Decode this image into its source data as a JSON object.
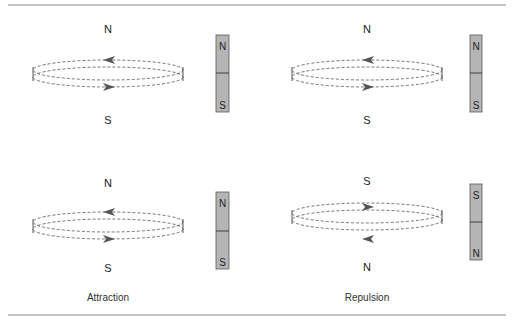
{
  "panels": [
    {
      "id": "top-left",
      "loop_top_label": "N",
      "loop_bottom_label": "S",
      "magnet_top_pole": "N",
      "magnet_bottom_pole": "S",
      "upper_arrow": "left",
      "lower_arrow": "right"
    },
    {
      "id": "top-right",
      "loop_top_label": "N",
      "loop_bottom_label": "S",
      "magnet_top_pole": "N",
      "magnet_bottom_pole": "S",
      "upper_arrow": "left",
      "lower_arrow": "right"
    },
    {
      "id": "bottom-left",
      "loop_top_label": "N",
      "loop_bottom_label": "S",
      "magnet_top_pole": "N",
      "magnet_bottom_pole": "S",
      "upper_arrow": "left",
      "lower_arrow": "right"
    },
    {
      "id": "bottom-right",
      "loop_top_label": "S",
      "loop_bottom_label": "N",
      "magnet_top_pole": "S",
      "magnet_bottom_pole": "N",
      "upper_arrow": "right",
      "lower_arrow": "left"
    }
  ],
  "captions": {
    "left": "Attraction",
    "right": "Repulsion"
  },
  "colors": {
    "magnet_fill": "#b5b5b5",
    "rule": "#8a8a8a",
    "arrow": "#555555"
  }
}
